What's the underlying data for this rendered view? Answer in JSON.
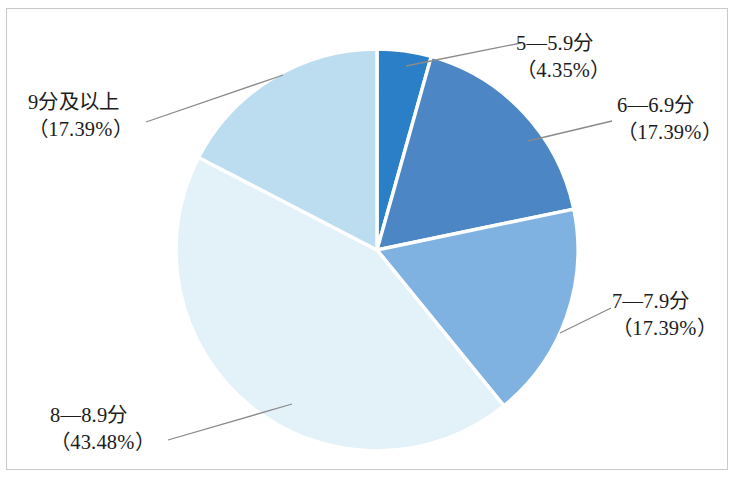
{
  "chart_data": {
    "type": "pie",
    "title": "",
    "subtitle": "",
    "xlabel": "",
    "ylabel": "",
    "legend_position": "none",
    "grid": false,
    "labels_show_percent": true,
    "start_angle_deg": -90,
    "direction": "clockwise",
    "categories": [
      "5—5.9分",
      "6—6.9分",
      "7—7.9分",
      "8—8.9分",
      "9分及以上"
    ],
    "values": [
      4.35,
      17.39,
      17.39,
      43.48,
      17.39
    ],
    "value_unit": "%",
    "slices": [
      {
        "label": "5—5.9分",
        "percent_text": "（4.35%）",
        "value": 4.35,
        "color": "#2b7fc6",
        "start_deg": -90.0,
        "end_deg": -74.34,
        "label_pos": "top-right"
      },
      {
        "label": "6—6.9分",
        "percent_text": "（17.39%）",
        "value": 17.39,
        "color": "#4c86c5",
        "start_deg": -74.34,
        "end_deg": -11.74,
        "label_pos": "right-upper"
      },
      {
        "label": "7—7.9分",
        "percent_text": "（17.39%）",
        "value": 17.39,
        "color": "#7fb2e0",
        "start_deg": -11.74,
        "end_deg": 50.86,
        "label_pos": "right-lower"
      },
      {
        "label": "8—8.9分",
        "percent_text": "（43.48%）",
        "value": 43.48,
        "color": "#e3f1f8",
        "start_deg": 50.86,
        "end_deg": 207.42,
        "label_pos": "bottom-left"
      },
      {
        "label": "9分及以上",
        "percent_text": "（17.39%）",
        "value": 17.39,
        "color": "#bcdcf0",
        "start_deg": 207.42,
        "end_deg": 270.0,
        "label_pos": "top-left"
      }
    ],
    "geometry": {
      "center_x": 377,
      "center_y": 250,
      "radius": 201
    },
    "colors": {
      "slice_border": "#ffffff",
      "leader_line": "#8a8a8a",
      "frame": "#c9c9c9",
      "text": "#1c1c1c",
      "background": "#ffffff"
    }
  }
}
